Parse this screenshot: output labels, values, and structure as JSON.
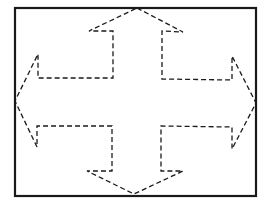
{
  "diagram": {
    "type": "four-way-arrow",
    "frame": {
      "x": 15,
      "y": 8,
      "width": 241,
      "height": 188,
      "stroke": "#1a1a1a",
      "stroke_width": 2.2
    },
    "arrow": {
      "stroke": "#1a1a1a",
      "stroke_width": 1.3,
      "dash": "5 3",
      "points": "137,8 183,32 162,31 162,79 232,80 232,56 256,103 232,149 232,127 161,126 161,171 183,171 134,194 87,171 112,171 112,126 37,126 37,147 15,101 38,54 38,78 113,78 113,31 89,31"
    },
    "directions": [
      "up",
      "right",
      "down",
      "left"
    ]
  }
}
